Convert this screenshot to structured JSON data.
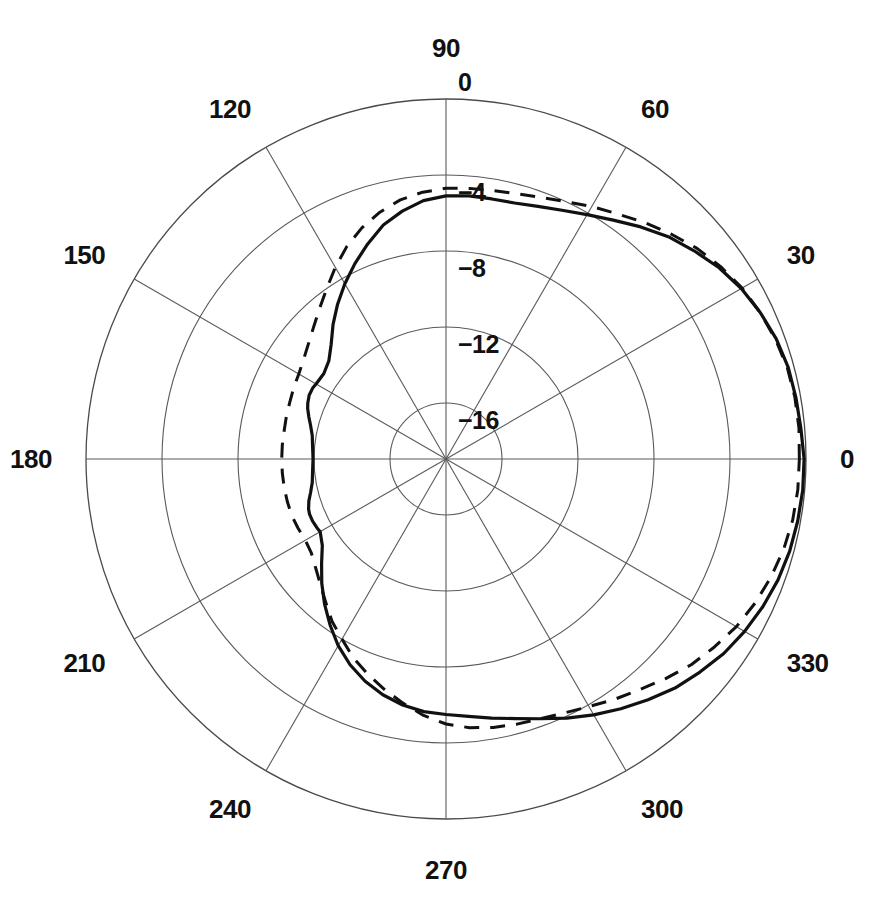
{
  "chart_data": {
    "type": "line",
    "subtype": "polar-radiation-pattern",
    "title": "",
    "xlabel": "",
    "ylabel": "",
    "angular_unit": "degrees",
    "radial_unit": "dB",
    "rlim": [
      -20,
      0
    ],
    "grid": true,
    "legend_position": "none",
    "angular_direction": "counterclockwise",
    "angular_zero_at": "east",
    "angle_ticks": [
      0,
      30,
      60,
      90,
      120,
      150,
      180,
      210,
      240,
      270,
      300,
      330
    ],
    "angle_tick_labels": [
      "0",
      "30",
      "60",
      "90",
      "120",
      "150",
      "180",
      "210",
      "240",
      "270",
      "300",
      "330"
    ],
    "radial_ticks": [
      0,
      -4,
      -8,
      -12,
      -16
    ],
    "radial_tick_labels": [
      "0",
      "−4",
      "−8",
      "−12",
      "−16"
    ],
    "series": [
      {
        "name": "solid",
        "style": "solid",
        "color": "#111111",
        "angles": [
          0,
          5,
          10,
          15,
          20,
          25,
          30,
          35,
          40,
          45,
          50,
          55,
          60,
          65,
          70,
          75,
          80,
          85,
          90,
          95,
          100,
          105,
          110,
          115,
          120,
          125,
          130,
          135,
          140,
          145,
          150,
          152,
          155,
          158,
          160,
          163,
          166,
          170,
          175,
          180,
          185,
          190,
          194,
          197,
          200,
          202,
          205,
          208,
          210,
          215,
          220,
          225,
          230,
          235,
          240,
          245,
          250,
          255,
          260,
          265,
          270,
          275,
          280,
          285,
          290,
          295,
          300,
          305,
          310,
          315,
          320,
          325,
          330,
          335,
          340,
          345,
          350,
          355,
          360
        ],
        "values": [
          -0.1,
          -0.2,
          -0.25,
          -0.3,
          -0.45,
          -0.7,
          -1.0,
          -1.4,
          -1.9,
          -2.4,
          -3.0,
          -3.6,
          -4.1,
          -4.5,
          -4.8,
          -5.0,
          -5.05,
          -5.05,
          -5.1,
          -5.3,
          -5.7,
          -6.2,
          -6.9,
          -7.6,
          -8.3,
          -9.0,
          -9.7,
          -10.4,
          -10.9,
          -11.1,
          -11.05,
          -11.0,
          -11.0,
          -11.1,
          -11.2,
          -11.4,
          -11.6,
          -11.8,
          -11.9,
          -11.95,
          -11.9,
          -11.8,
          -11.6,
          -11.4,
          -11.25,
          -11.2,
          -11.2,
          -11.25,
          -11.3,
          -11.0,
          -10.4,
          -9.7,
          -9.0,
          -8.3,
          -7.6,
          -7.0,
          -6.5,
          -6.1,
          -5.8,
          -5.6,
          -5.5,
          -5.35,
          -5.1,
          -4.8,
          -4.4,
          -3.9,
          -3.4,
          -2.9,
          -2.4,
          -1.9,
          -1.5,
          -1.1,
          -0.8,
          -0.55,
          -0.35,
          -0.22,
          -0.15,
          -0.1,
          -0.1
        ]
      },
      {
        "name": "dashed",
        "style": "dashed",
        "color": "#111111",
        "angles": [
          0,
          5,
          10,
          15,
          20,
          25,
          30,
          35,
          40,
          45,
          50,
          55,
          60,
          65,
          70,
          75,
          80,
          85,
          90,
          95,
          100,
          105,
          110,
          115,
          120,
          125,
          130,
          135,
          140,
          145,
          150,
          155,
          160,
          165,
          170,
          175,
          180,
          185,
          190,
          195,
          200,
          205,
          210,
          215,
          220,
          225,
          230,
          235,
          240,
          245,
          250,
          255,
          260,
          265,
          270,
          275,
          280,
          285,
          290,
          295,
          300,
          305,
          310,
          315,
          320,
          325,
          330,
          335,
          340,
          345,
          350,
          355,
          360
        ],
        "values": [
          -0.35,
          -0.3,
          -0.3,
          -0.35,
          -0.5,
          -0.7,
          -0.95,
          -1.3,
          -1.7,
          -2.2,
          -2.7,
          -3.2,
          -3.6,
          -4.0,
          -4.3,
          -4.5,
          -4.6,
          -4.65,
          -4.7,
          -4.85,
          -5.1,
          -5.5,
          -6.0,
          -6.6,
          -7.3,
          -8.0,
          -8.6,
          -9.1,
          -9.5,
          -9.8,
          -10.0,
          -10.1,
          -10.2,
          -10.25,
          -10.3,
          -10.3,
          -10.3,
          -10.3,
          -10.3,
          -10.3,
          -10.3,
          -10.35,
          -10.4,
          -10.3,
          -10.0,
          -9.6,
          -9.1,
          -8.5,
          -8.0,
          -7.4,
          -6.9,
          -6.4,
          -5.9,
          -5.4,
          -5.0,
          -4.75,
          -4.6,
          -4.5,
          -4.4,
          -4.2,
          -3.9,
          -3.5,
          -3.1,
          -2.6,
          -2.1,
          -1.7,
          -1.3,
          -1.0,
          -0.75,
          -0.55,
          -0.42,
          -0.36,
          -0.35
        ]
      }
    ]
  },
  "plot": {
    "center_x": 446,
    "center_y": 459,
    "outer_radius": 360,
    "ring_step_px": 76,
    "radial_label_offset_x": 12
  }
}
